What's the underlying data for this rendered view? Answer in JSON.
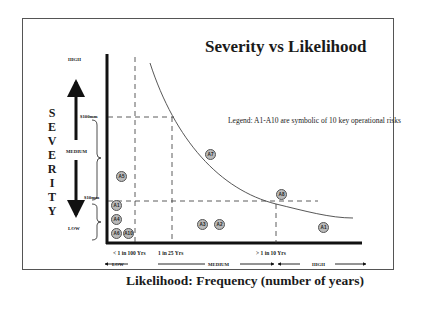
{
  "slide": {
    "title": "Severity vs Likelihood",
    "legend": "Legend:  A1-A10 are symbolic of 10 key operational risks",
    "y_axis": {
      "title_letters": [
        "S",
        "E",
        "V",
        "E",
        "R",
        "I",
        "T",
        "Y"
      ],
      "levels": {
        "high": "HIGH",
        "medium": "MEDIUM",
        "low": "LOW"
      },
      "thresholds": {
        "upper": "$100mm",
        "lower": "$10mm"
      }
    },
    "x_axis": {
      "title": "Likelihood: Frequency (number of years)",
      "ticks": [
        "< 1 in 100 Yrs",
        "1 in 25 Yrs",
        "> 1 in 10 Yrs"
      ],
      "levels": {
        "low": "LOW",
        "medium": "MEDIUM",
        "high": "HIGH"
      }
    },
    "risks": [
      {
        "id": "A1",
        "label": "A1",
        "x": 116,
        "y": 206
      },
      {
        "id": "A4",
        "label": "A4",
        "x": 116,
        "y": 220
      },
      {
        "id": "A6",
        "label": "A6",
        "x": 116,
        "y": 234
      },
      {
        "id": "A10",
        "label": "A10",
        "x": 129,
        "y": 234
      },
      {
        "id": "A5",
        "label": "A5",
        "x": 121,
        "y": 177
      },
      {
        "id": "A7",
        "label": "A7",
        "x": 211,
        "y": 155
      },
      {
        "id": "A3",
        "label": "A3",
        "x": 203,
        "y": 224
      },
      {
        "id": "A2",
        "label": "A2",
        "x": 220,
        "y": 224
      },
      {
        "id": "A8",
        "label": "A8",
        "x": 282,
        "y": 195
      },
      {
        "id": "A1b",
        "label": "A1",
        "x": 323,
        "y": 227
      }
    ]
  }
}
